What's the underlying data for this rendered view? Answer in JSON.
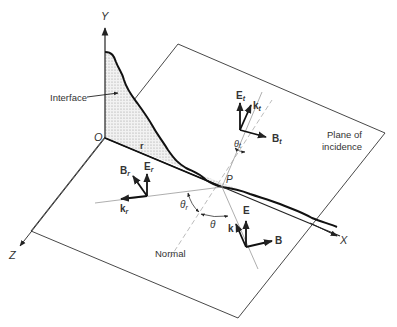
{
  "axes": {
    "y_label": "Y",
    "x_label": "X",
    "z_label": "Z",
    "origin_label": "O"
  },
  "labels": {
    "interface": "Interface",
    "plane_line1": "Plane of",
    "plane_line2": "incidence",
    "normal": "Normal",
    "point_p": "P",
    "r": "r"
  },
  "incident": {
    "E": "E",
    "k": "k",
    "B": "B",
    "theta": "θ"
  },
  "reflected": {
    "E": "E",
    "E_sub": "r",
    "k": "k",
    "k_sub": "r",
    "B": "B",
    "B_sub": "r",
    "theta": "θ",
    "theta_sub": "r"
  },
  "transmitted": {
    "E": "E",
    "E_sub": "t",
    "k": "k",
    "k_sub": "t",
    "B": "B",
    "B_sub": "t",
    "theta": "θ",
    "theta_sub": "t"
  },
  "colors": {
    "line": "#222222",
    "light_line": "#999999",
    "hatch": "#c8c8c8"
  }
}
